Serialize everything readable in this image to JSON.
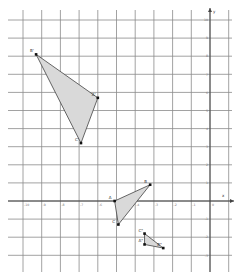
{
  "diagram": {
    "type": "coordinate-grid-transformations",
    "axes": {
      "x_label": "x",
      "y_label": "y",
      "x_ticks": [
        "-10",
        "-9",
        "-8",
        "-7",
        "-6",
        "-5",
        "-4",
        "-3",
        "-2",
        "-1"
      ],
      "y_ticks": [
        "10",
        "9",
        "8",
        "7",
        "6",
        "5",
        "4",
        "3",
        "2",
        "1",
        "-1",
        "-2",
        "-3"
      ],
      "origin_label": "0"
    },
    "colors": {
      "grid": "#8a8a8a",
      "axis": "#444444",
      "fill": "#d9d9d9",
      "edge": "#555555",
      "point": "#111111",
      "background": "#ffffff"
    },
    "triangles": [
      {
        "name": "A'B'C'",
        "vertices": [
          {
            "label": "B'",
            "x": -9.3,
            "y": 8.1
          },
          {
            "label": "A'",
            "x": -6.0,
            "y": 5.7
          },
          {
            "label": "C'",
            "x": -6.9,
            "y": 3.2
          }
        ]
      },
      {
        "name": "ABC",
        "vertices": [
          {
            "label": "A",
            "x": -5.1,
            "y": 0.0
          },
          {
            "label": "B",
            "x": -3.2,
            "y": 0.9
          },
          {
            "label": "C",
            "x": -4.9,
            "y": -1.3
          }
        ]
      },
      {
        "name": "A''B''C''",
        "vertices": [
          {
            "label": "C\"",
            "x": -3.5,
            "y": -1.8
          },
          {
            "label": "A\"",
            "x": -3.5,
            "y": -2.4
          },
          {
            "label": "B\"",
            "x": -2.5,
            "y": -2.6
          }
        ]
      }
    ]
  }
}
